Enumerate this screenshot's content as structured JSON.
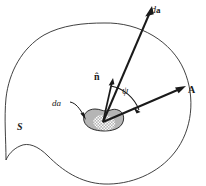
{
  "figure": {
    "background_color": "#ffffff",
    "line_color": "#2b2b2b",
    "patch_fill_color": "#b5b5b5",
    "patch_stroke_color": "#1a1a1a",
    "labels": {
      "vector_area_element": "d",
      "vector_area_element_bold": "a",
      "unit_normal": "n̂",
      "angle": "ψ",
      "field_vector": "A",
      "scalar_area_element": "da",
      "surface": "S"
    },
    "geometry": {
      "vertex": {
        "x": 103,
        "y": 122
      },
      "da_vector_tip": {
        "x": 152,
        "y": 8
      },
      "n_hat_tip": {
        "x": 113,
        "y": 79
      },
      "A_vector_tip": {
        "x": 186,
        "y": 86
      },
      "angle_arc_label_position": {
        "x": 122,
        "y": 86
      }
    }
  }
}
